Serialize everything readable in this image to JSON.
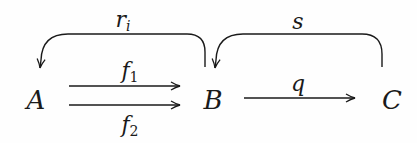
{
  "diagram": {
    "type": "commutative-diagram",
    "nodes": [
      {
        "id": "A",
        "label": "A",
        "x": 36,
        "y": 100
      },
      {
        "id": "B",
        "label": "B",
        "x": 213,
        "y": 100
      },
      {
        "id": "C",
        "label": "C",
        "x": 392,
        "y": 100
      }
    ],
    "edges": [
      {
        "id": "f1",
        "from": "A",
        "to": "B",
        "label": "f",
        "subscript": "1",
        "shape": "straight"
      },
      {
        "id": "f2",
        "from": "A",
        "to": "B",
        "label": "f",
        "subscript": "2",
        "shape": "straight"
      },
      {
        "id": "q",
        "from": "B",
        "to": "C",
        "label": "q",
        "subscript": "",
        "shape": "straight"
      },
      {
        "id": "r_i",
        "from": "B",
        "to": "A",
        "label": "r",
        "subscript": "i",
        "shape": "curved-over"
      },
      {
        "id": "s",
        "from": "C",
        "to": "B",
        "label": "s",
        "subscript": "",
        "shape": "curved-over"
      }
    ],
    "colors": {
      "ink": "#1a1a1a",
      "background": "#fefefe"
    }
  }
}
